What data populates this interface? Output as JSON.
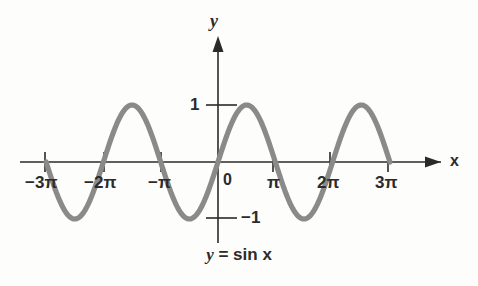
{
  "figure": {
    "caption": "y = sin x",
    "caption_parts": {
      "lhs": "y",
      "eq": "=",
      "rhs_fn": "sin",
      "rhs_var": "x"
    },
    "background_color": "#fdfdfb",
    "axis_color": "#2a2a2a",
    "curve_color": "#8a8a8a",
    "text_color": "#2b2b2b"
  },
  "axes": {
    "x_label": "x",
    "y_label": "y",
    "origin_label": "0",
    "x_axis_arrow": "arrow-right",
    "y_axis_arrow": "arrow-up"
  },
  "chart_data": {
    "type": "line",
    "xlabel": "x",
    "ylabel": "y",
    "function": "y = sin x",
    "xlim": [
      -10.12,
      10.12
    ],
    "ylim": [
      -2.2,
      2.2
    ],
    "grid": false,
    "legend": null,
    "amplitude": 1,
    "period": "2π",
    "x_ticks": [
      {
        "value": -9.4248,
        "label": "−3π",
        "pixel_x": 45
      },
      {
        "value": -6.2832,
        "label": "−2π",
        "pixel_x": 104
      },
      {
        "value": -3.1416,
        "label": "−π",
        "pixel_x": 161
      },
      {
        "value": 0,
        "label": "0",
        "pixel_x": 218
      },
      {
        "value": 3.1416,
        "label": "π",
        "pixel_x": 273
      },
      {
        "value": 6.2832,
        "label": "2π",
        "pixel_x": 330
      },
      {
        "value": 9.4248,
        "label": "3π",
        "pixel_x": 388
      }
    ],
    "y_ticks": [
      {
        "value": 1,
        "label": "1",
        "pixel_y": 105
      },
      {
        "value": -1,
        "label": "−1",
        "pixel_y": 218
      }
    ],
    "key_points": [
      {
        "x": -9.4248,
        "y": 0,
        "note": "zero at -3π"
      },
      {
        "x": -7.854,
        "y": -1,
        "note": "minimum"
      },
      {
        "x": -6.2832,
        "y": 0,
        "note": "zero at -2π"
      },
      {
        "x": -4.7124,
        "y": 1,
        "note": "maximum"
      },
      {
        "x": -3.1416,
        "y": 0,
        "note": "zero at -π"
      },
      {
        "x": -1.5708,
        "y": -1,
        "note": "minimum"
      },
      {
        "x": 0,
        "y": 0,
        "note": "origin"
      },
      {
        "x": 1.5708,
        "y": 1,
        "note": "maximum"
      },
      {
        "x": 3.1416,
        "y": 0,
        "note": "zero at π"
      },
      {
        "x": 4.7124,
        "y": -1,
        "note": "minimum"
      },
      {
        "x": 6.2832,
        "y": 0,
        "note": "zero at 2π"
      },
      {
        "x": 7.854,
        "y": 1,
        "note": "maximum"
      },
      {
        "x": 9.4248,
        "y": 0,
        "note": "zero at 3π"
      }
    ],
    "domain_drawn": [
      -9.4248,
      9.4248
    ],
    "series": [
      {
        "name": "sin x",
        "color": "#8a8a8a",
        "x": [
          -9.4248,
          -8.6394,
          -7.854,
          -7.0686,
          -6.2832,
          -5.4978,
          -4.7124,
          -3.927,
          -3.1416,
          -2.3562,
          -1.5708,
          -0.7854,
          0,
          0.7854,
          1.5708,
          2.3562,
          3.1416,
          3.927,
          4.7124,
          5.4978,
          6.2832,
          7.0686,
          7.854,
          8.6394,
          9.4248
        ],
        "values": [
          0,
          -0.7071,
          -1,
          -0.7071,
          0,
          0.7071,
          1,
          0.7071,
          0,
          -0.7071,
          -1,
          -0.7071,
          0,
          0.7071,
          1,
          0.7071,
          0,
          -0.7071,
          -1,
          -0.7071,
          0,
          0.7071,
          1,
          0.7071,
          0
        ]
      }
    ]
  }
}
